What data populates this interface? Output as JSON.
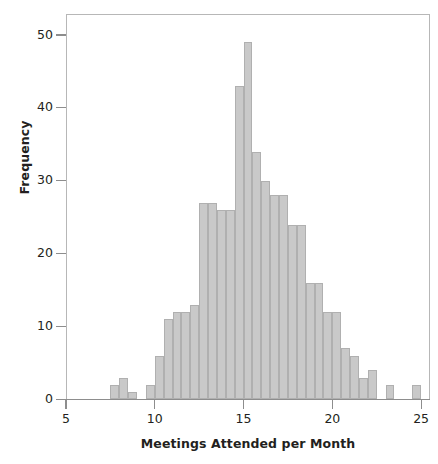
{
  "chart_data": {
    "type": "bar",
    "title": "",
    "subtitle": "",
    "xlabel": "Meetings Attended per Month",
    "ylabel": "Frequency",
    "grid": false,
    "legend": "none",
    "bin_width": 0.5,
    "xlim": [
      5,
      25.5
    ],
    "ylim": [
      0,
      52
    ],
    "xticks": [
      5,
      10,
      15,
      20,
      25
    ],
    "xtick_labels": [
      "5",
      "10",
      "15",
      "20",
      "25"
    ],
    "yticks": [
      0,
      10,
      20,
      30,
      40,
      50
    ],
    "ytick_labels": [
      "0",
      "10",
      "20",
      "30",
      "40",
      "50"
    ],
    "bar_color": "#c9c9c9",
    "bar_edge_color": "#b0b0b0",
    "axis_color": "#8d8d8d",
    "bin_starts": [
      7.5,
      8.0,
      8.5,
      9.0,
      9.5,
      10.0,
      10.5,
      11.0,
      11.5,
      12.0,
      12.5,
      13.0,
      13.5,
      14.0,
      14.5,
      15.0,
      15.5,
      16.0,
      16.5,
      17.0,
      17.5,
      18.0,
      18.5,
      19.0,
      19.5,
      20.0,
      20.5,
      21.0,
      21.5,
      22.0,
      23.0,
      24.5
    ],
    "values": [
      2,
      3,
      1,
      2,
      6,
      11,
      12,
      13,
      27,
      27,
      26,
      43,
      49,
      34,
      30,
      28,
      24,
      16,
      16,
      12,
      7,
      6,
      3,
      4,
      2,
      2
    ],
    "bins": [
      {
        "start": 7.5,
        "end": 8.0,
        "value": 2
      },
      {
        "start": 8.0,
        "end": 8.5,
        "value": 3
      },
      {
        "start": 8.5,
        "end": 9.0,
        "value": 1
      },
      {
        "start": 9.0,
        "end": 9.5,
        "value": 0
      },
      {
        "start": 9.5,
        "end": 10.0,
        "value": 2
      },
      {
        "start": 10.0,
        "end": 10.5,
        "value": 6
      },
      {
        "start": 10.5,
        "end": 11.0,
        "value": 11
      },
      {
        "start": 11.0,
        "end": 11.5,
        "value": 12
      },
      {
        "start": 11.5,
        "end": 12.0,
        "value": 12
      },
      {
        "start": 12.0,
        "end": 12.5,
        "value": 13
      },
      {
        "start": 12.5,
        "end": 13.0,
        "value": 27
      },
      {
        "start": 13.0,
        "end": 13.5,
        "value": 27
      },
      {
        "start": 13.5,
        "end": 14.0,
        "value": 26
      },
      {
        "start": 14.0,
        "end": 14.5,
        "value": 26
      },
      {
        "start": 14.5,
        "end": 15.0,
        "value": 43
      },
      {
        "start": 15.0,
        "end": 15.5,
        "value": 49
      },
      {
        "start": 15.5,
        "end": 16.0,
        "value": 34
      },
      {
        "start": 16.0,
        "end": 16.5,
        "value": 30
      },
      {
        "start": 16.5,
        "end": 17.0,
        "value": 28
      },
      {
        "start": 17.0,
        "end": 17.5,
        "value": 28
      },
      {
        "start": 17.5,
        "end": 18.0,
        "value": 24
      },
      {
        "start": 18.0,
        "end": 18.5,
        "value": 24
      },
      {
        "start": 18.5,
        "end": 19.0,
        "value": 16
      },
      {
        "start": 19.0,
        "end": 19.5,
        "value": 16
      },
      {
        "start": 19.5,
        "end": 20.0,
        "value": 12
      },
      {
        "start": 20.0,
        "end": 20.5,
        "value": 12
      },
      {
        "start": 20.5,
        "end": 21.0,
        "value": 7
      },
      {
        "start": 21.0,
        "end": 21.5,
        "value": 6
      },
      {
        "start": 21.5,
        "end": 22.0,
        "value": 3
      },
      {
        "start": 22.0,
        "end": 22.5,
        "value": 4
      },
      {
        "start": 23.0,
        "end": 23.5,
        "value": 2
      },
      {
        "start": 24.5,
        "end": 25.0,
        "value": 2
      }
    ]
  }
}
